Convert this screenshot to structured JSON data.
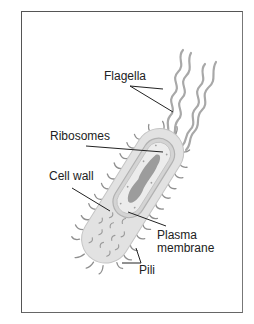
{
  "diagram": {
    "labels": {
      "flagella": "Flagella",
      "ribosomes": "Ribosomes",
      "cell_wall": "Cell wall",
      "plasma_membrane_line1": "Plasma",
      "plasma_membrane_line2": "membrane",
      "pili": "Pili"
    },
    "colors": {
      "frame": "#555555",
      "leader_line": "#222222",
      "cell_body": "#d9d9d9",
      "cell_outline": "#bdbdbd",
      "cytoplasm": "#c8c8c8",
      "nucleoid": "#9a9a9a",
      "appendage": "#8c8c8c"
    }
  }
}
